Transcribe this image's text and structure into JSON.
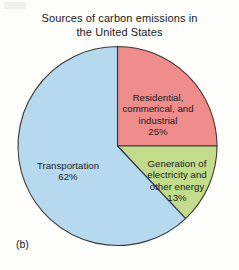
{
  "figure": {
    "label": "(b)"
  },
  "chart_data": {
    "type": "pie",
    "title": "Sources of carbon emissions in\nthe United States",
    "xlabel": "",
    "ylabel": "",
    "grid": false,
    "legend": "none",
    "units": "percent",
    "start_angle_deg": 0,
    "direction": "clockwise",
    "categories": [
      "Residential, commerical, and industrial",
      "Generation of electricity and other energy",
      "Transportation"
    ],
    "values": [
      25,
      13,
      62
    ],
    "colors": [
      "#ef8c8c",
      "#c2dc8c",
      "#b7d9ef"
    ],
    "outline_color": "#3a3a3a",
    "slices": [
      {
        "name": "Residential, commerical, and industrial",
        "label": "Residential,\ncommerical, and\nindustrial",
        "percent_text": "25%",
        "value": 25,
        "color": "#ef8c8c",
        "start_deg": 0,
        "end_deg": 90
      },
      {
        "name": "Generation of electricity and other energy",
        "label": "Generation of\nelectricity and\nother energy",
        "percent_text": "13%",
        "value": 13,
        "color": "#c2dc8c",
        "start_deg": 90,
        "end_deg": 136.8
      },
      {
        "name": "Transportation",
        "label": "Transportation",
        "percent_text": "62%",
        "value": 62,
        "color": "#b7d9ef",
        "start_deg": 136.8,
        "end_deg": 360
      }
    ]
  }
}
